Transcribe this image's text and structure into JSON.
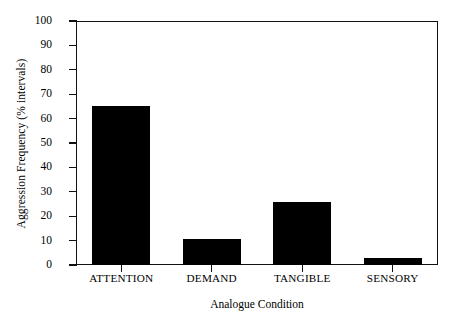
{
  "chart_data": {
    "type": "bar",
    "title": "",
    "xlabel": "Analogue Condition",
    "ylabel": "Aggression Frequency (% intervals)",
    "categories": [
      "ATTENTION",
      "DEMAND",
      "TANGIBLE",
      "SENSORY"
    ],
    "values": [
      65,
      10.5,
      26,
      3
    ],
    "ylim": [
      0,
      100
    ],
    "yticks": [
      0,
      10,
      20,
      30,
      40,
      50,
      60,
      70,
      80,
      90,
      100
    ],
    "ytick_labels": [
      "0",
      "10",
      "20",
      "30",
      "40",
      "50",
      "60",
      "70",
      "80",
      "90",
      "100"
    ],
    "grid": false,
    "legend": null,
    "bar_color": "#000000",
    "frame_color": "#111111",
    "background": "#ffffff"
  }
}
